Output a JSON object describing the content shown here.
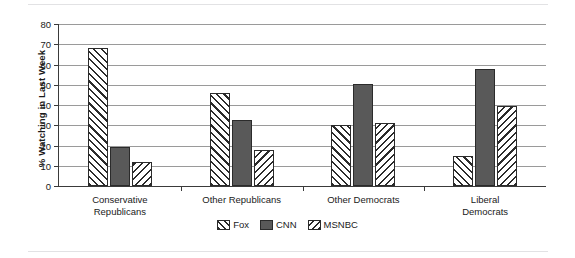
{
  "chart_data": {
    "type": "bar",
    "title": "",
    "xlabel": "",
    "ylabel": "% Watching in Last Week",
    "ylim": [
      0,
      80
    ],
    "yticks": [
      0,
      10,
      20,
      30,
      40,
      50,
      60,
      70,
      80
    ],
    "ytick_labels": [
      "0",
      "10",
      "20",
      "30",
      "40",
      "50",
      "60",
      "70",
      "80"
    ],
    "grid": true,
    "legend_position": "bottom-center",
    "categories": [
      "Conservative\nRepublicans",
      "Other Republicans",
      "Other Democrats",
      "Liberal Democrats"
    ],
    "series": [
      {
        "name": "Fox",
        "values": [
          68,
          46,
          30,
          15
        ],
        "pattern": "forward-hatch",
        "color": "#ffffff"
      },
      {
        "name": "CNN",
        "values": [
          19.5,
          32.5,
          50.5,
          58
        ],
        "pattern": "solid",
        "color": "#595959"
      },
      {
        "name": "MSNBC",
        "values": [
          12,
          18,
          31,
          39.5
        ],
        "pattern": "backward-hatch",
        "color": "#ffffff"
      }
    ]
  },
  "legend": {
    "entries": [
      {
        "label": "Fox"
      },
      {
        "label": "CNN"
      },
      {
        "label": "MSNBC"
      }
    ]
  },
  "colors": {
    "cnn_fill": "#595959",
    "hatch_stroke": "#2b2b2b",
    "gridline": "#9a9a9a",
    "axis": "#3a3a3a",
    "background": "#ffffff"
  }
}
